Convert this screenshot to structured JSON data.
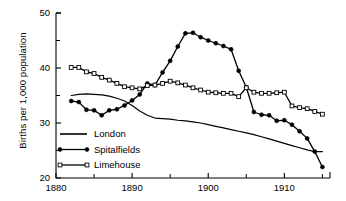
{
  "chart_data": {
    "type": "line",
    "title": "",
    "xlabel": "",
    "ylabel": "Births per 1,000 population",
    "xlim": [
      1880,
      1916
    ],
    "ylim": [
      20,
      50
    ],
    "xticks": [
      1880,
      1890,
      1900,
      1910
    ],
    "xtick_labels": [
      "1880",
      "1890",
      "1900",
      "1910"
    ],
    "xminor_ticks": [
      1885,
      1895,
      1905,
      1915
    ],
    "yticks": [
      20,
      30,
      40,
      50
    ],
    "ytick_labels": [
      "20",
      "30",
      "40",
      "50"
    ],
    "yminor_ticks": [
      25,
      35,
      45
    ],
    "grid": false,
    "legend_position": "lower-left-inside",
    "series": [
      {
        "name": "London",
        "marker": "none",
        "color": "#000000",
        "x": [
          1882,
          1883,
          1884,
          1885,
          1886,
          1887,
          1888,
          1889,
          1890,
          1891,
          1892,
          1893,
          1894,
          1895,
          1896,
          1897,
          1898,
          1899,
          1900,
          1901,
          1902,
          1903,
          1904,
          1905,
          1906,
          1907,
          1908,
          1909,
          1910,
          1911,
          1912,
          1913,
          1914,
          1915
        ],
        "values": [
          35.0,
          35.2,
          35.3,
          35.2,
          35.1,
          34.9,
          34.5,
          34.0,
          33.2,
          32.2,
          31.4,
          30.9,
          30.8,
          30.7,
          30.5,
          30.4,
          30.2,
          30.0,
          29.7,
          29.4,
          29.1,
          28.8,
          28.5,
          28.2,
          27.9,
          27.5,
          27.1,
          26.7,
          26.3,
          25.9,
          25.5,
          25.1,
          24.8,
          24.8
        ]
      },
      {
        "name": "Spitalfields",
        "marker": "filled-circle",
        "color": "#000000",
        "x": [
          1882,
          1883,
          1884,
          1885,
          1886,
          1887,
          1888,
          1889,
          1890,
          1891,
          1892,
          1893,
          1894,
          1895,
          1896,
          1897,
          1898,
          1899,
          1900,
          1901,
          1902,
          1903,
          1904,
          1905,
          1906,
          1907,
          1908,
          1909,
          1910,
          1911,
          1912,
          1913,
          1914,
          1915
        ],
        "values": [
          34.0,
          33.8,
          32.4,
          32.3,
          31.4,
          32.3,
          32.5,
          33.2,
          34.1,
          35.2,
          37.2,
          36.9,
          39.2,
          41.3,
          43.9,
          46.3,
          46.4,
          45.6,
          45.0,
          44.5,
          44.0,
          43.4,
          39.5,
          36.5,
          32.0,
          31.5,
          31.4,
          30.4,
          30.5,
          29.7,
          28.5,
          27.2,
          24.8,
          22.0
        ]
      },
      {
        "name": "Limehouse",
        "marker": "open-square",
        "color": "#000000",
        "x": [
          1882,
          1883,
          1884,
          1885,
          1886,
          1887,
          1888,
          1889,
          1890,
          1891,
          1892,
          1893,
          1894,
          1895,
          1896,
          1897,
          1898,
          1899,
          1900,
          1901,
          1902,
          1903,
          1904,
          1905,
          1906,
          1907,
          1908,
          1909,
          1910,
          1911,
          1912,
          1913,
          1914,
          1915
        ],
        "values": [
          40.1,
          40.1,
          39.3,
          39.0,
          38.3,
          37.8,
          37.2,
          36.6,
          36.4,
          36.2,
          36.8,
          36.9,
          37.2,
          37.6,
          37.3,
          36.9,
          36.4,
          36.0,
          35.6,
          35.5,
          35.4,
          35.4,
          34.8,
          36.4,
          35.6,
          35.4,
          35.4,
          35.5,
          35.6,
          33.1,
          32.8,
          32.6,
          32.1,
          31.6
        ]
      }
    ]
  },
  "legend": {
    "items": [
      {
        "label": "London",
        "marker": "none"
      },
      {
        "label": "Spitalfields",
        "marker": "filled-circle"
      },
      {
        "label": "Limehouse",
        "marker": "open-square"
      }
    ]
  },
  "axis": {
    "y_title": "Births per 1,000 population"
  }
}
